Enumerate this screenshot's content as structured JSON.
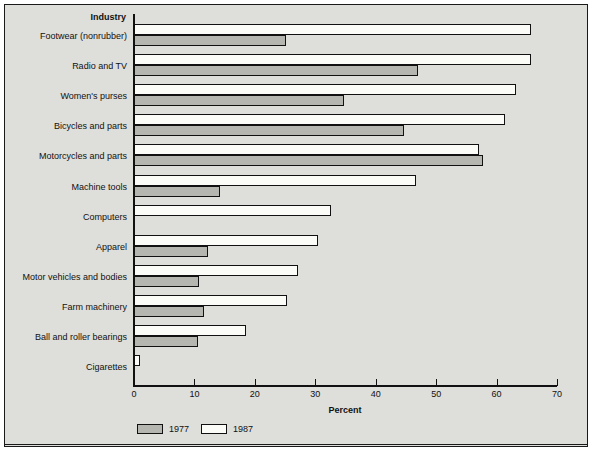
{
  "chart_data": {
    "type": "bar",
    "orientation": "horizontal",
    "title": "",
    "xlabel": "Percent",
    "ylabel": "Industry",
    "xlim": [
      0,
      70
    ],
    "xticks": [
      0,
      10,
      20,
      30,
      40,
      50,
      60,
      70
    ],
    "grid": false,
    "legend_position": "bottom-left",
    "categories": [
      "Footwear (nonrubber)",
      "Radio and TV",
      "Women's purses",
      "Bicycles and parts",
      "Motorcycles and parts",
      "Machine tools",
      "Computers",
      "Apparel",
      "Motor vehicles and bodies",
      "Farm machinery",
      "Ball and roller bearings",
      "Cigarettes"
    ],
    "series": [
      {
        "name": "1977",
        "color": "#b6b6b0",
        "values": [
          25.2,
          47.0,
          34.8,
          44.6,
          57.8,
          14.2,
          0.0,
          12.2,
          10.8,
          11.6,
          10.6,
          0.0
        ]
      },
      {
        "name": "1987",
        "color": "#fbfbf8",
        "values": [
          65.7,
          65.7,
          63.2,
          61.4,
          57.1,
          46.7,
          32.6,
          30.4,
          27.2,
          25.4,
          18.6,
          1.0
        ]
      }
    ]
  },
  "axis": {
    "header_label": "Industry",
    "x_title": "Percent",
    "tick_labels": [
      "0",
      "10",
      "20",
      "30",
      "40",
      "50",
      "60",
      "70"
    ]
  },
  "legend": {
    "items": [
      {
        "label": "1977",
        "color": "#b6b6b0"
      },
      {
        "label": "1987",
        "color": "#fbfbf8"
      }
    ]
  }
}
